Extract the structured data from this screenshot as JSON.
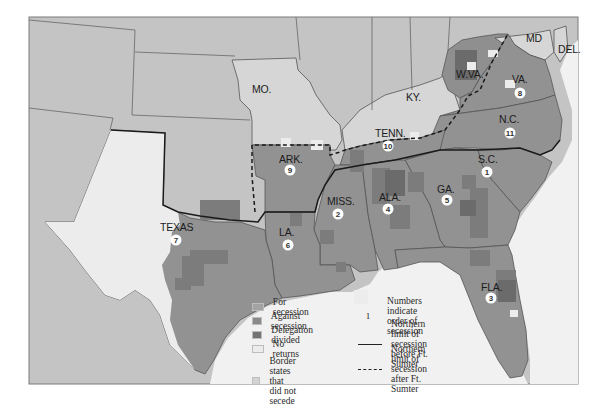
{
  "map": {
    "subject": "Secession of Southern States 1860-1861",
    "colors": {
      "for_secession": "#9a9a9a",
      "against_secession": "#878787",
      "delegation_divided": "#6f6f6f",
      "no_returns": "#ebebeb",
      "border_states": "#d6d6d6",
      "other_land": "#c4c4c4",
      "water": "#f2f2f2",
      "frame": "#7a7a7a"
    },
    "states": [
      {
        "label": "MO.",
        "order": null
      },
      {
        "label": "KY.",
        "order": null
      },
      {
        "label": "W.VA.",
        "order": null
      },
      {
        "label": "MD",
        "order": null
      },
      {
        "label": "DEL.",
        "order": null
      },
      {
        "label": "VA.",
        "order": "8"
      },
      {
        "label": "N.C.",
        "order": "11"
      },
      {
        "label": "TENN.",
        "order": "10"
      },
      {
        "label": "ARK.",
        "order": "9"
      },
      {
        "label": "S.C.",
        "order": "1"
      },
      {
        "label": "MISS.",
        "order": "2"
      },
      {
        "label": "ALA.",
        "order": "4"
      },
      {
        "label": "GA.",
        "order": "5"
      },
      {
        "label": "FLA.",
        "order": "3"
      },
      {
        "label": "LA.",
        "order": "6"
      },
      {
        "label": "TEXAS",
        "order": "7"
      }
    ]
  },
  "legend": {
    "swatches": [
      {
        "label": "For secession",
        "color": "#a3a3a3"
      },
      {
        "label": "Against secession",
        "color": "#8a8a8a"
      },
      {
        "label": "Delegation divided",
        "color": "#737373"
      },
      {
        "label": "No returns",
        "color": "#ececec"
      },
      {
        "label": "Border states that\ndid not secede",
        "color": "#d2d2d2"
      }
    ],
    "symbols": [
      {
        "symbol": "1",
        "label": "Numbers indicate\norder of secession"
      },
      {
        "symbol": "solid-line",
        "label": "Northern limit of secession\nbefore Ft. Sumter"
      },
      {
        "symbol": "dashed-line",
        "label": "Northern limit of secession\nafter Ft. Sumter"
      }
    ]
  }
}
